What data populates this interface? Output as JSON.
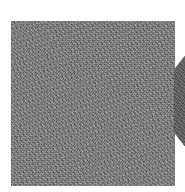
{
  "image": {
    "description": "Grayscale noise-textured square with a partial dark shape at the right edge",
    "background_color": "#ffffff",
    "square_color": "#7a7a7a",
    "side_shape_color": "#5c5c5c"
  }
}
